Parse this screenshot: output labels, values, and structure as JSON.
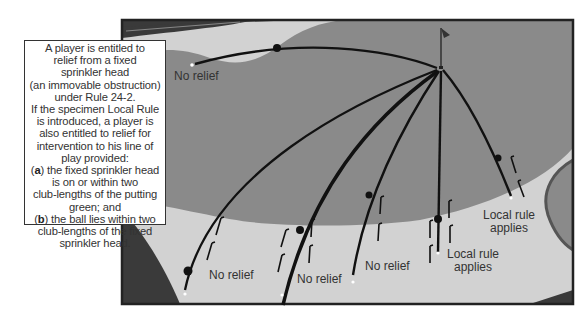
{
  "infobox": {
    "lines": [
      "A player is entitled to",
      "relief from a fixed",
      "sprinkler head",
      "(an immovable obstruction)",
      "under Rule 24-2.",
      "If the specimen Local Rule",
      "is introduced, a player is",
      "also entitled to relief for",
      "intervention to his line of",
      "play provided:"
    ],
    "item_a_marker": "a",
    "item_a_lines": [
      "the fixed sprinkler head",
      "is on or within two",
      "club-lengths of the putting",
      "green; and"
    ],
    "item_b_marker": "b",
    "item_b_lines": [
      "the ball lies within two",
      "club-lengths of the fixed",
      "sprinkler head."
    ]
  },
  "labels": {
    "top_left": "No relief",
    "bottom_1": "No relief",
    "bottom_2": "No relief",
    "bottom_3": "No relief",
    "local_1_a": "Local rule",
    "local_1_b": "applies",
    "local_2_a": "Local rule",
    "local_2_b": "applies"
  },
  "icons": {
    "flag": "flagstick-icon",
    "sprinkler": "sprinkler-head-icon",
    "ball": "ball-icon"
  },
  "colors": {
    "rough_dark": "#3a3a3a",
    "fairway_light": "#d2d2d2",
    "green_mid": "#8a8a8a",
    "path_line": "#111111",
    "frame": "#222222"
  }
}
